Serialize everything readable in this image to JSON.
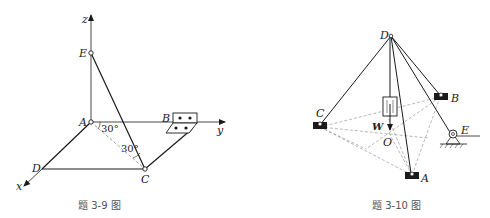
{
  "figures": [
    {
      "id": "3-9",
      "caption": "题 3-9 图",
      "axes": {
        "x": "x",
        "y": "y",
        "z": "z"
      },
      "points": {
        "A": "A",
        "B": "B",
        "C": "C",
        "D": "D",
        "E": "E"
      },
      "angles": [
        "30°",
        "30°"
      ]
    },
    {
      "id": "3-10",
      "caption": "题 3-10 图",
      "points": {
        "A": "A",
        "B": "B",
        "C": "C",
        "D": "D",
        "E": "E",
        "O": "O"
      },
      "load_label": "W"
    }
  ],
  "colors": {
    "line": "#1a1a1a",
    "dashed": "#777777",
    "caption": "#555555"
  }
}
